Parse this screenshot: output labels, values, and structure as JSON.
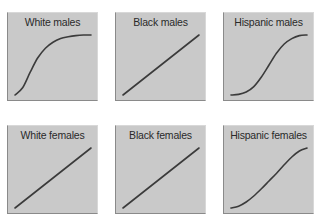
{
  "chart_data": [
    {
      "type": "line",
      "title": "White males",
      "shape": "concave-saturating (rapid rise then plateau)",
      "x": [
        0,
        0.1,
        0.2,
        0.3,
        0.4,
        0.5,
        0.6,
        0.7,
        0.8,
        0.9,
        1.0
      ],
      "y": [
        0.0,
        0.12,
        0.38,
        0.62,
        0.78,
        0.88,
        0.94,
        0.97,
        0.99,
        1.0,
        1.0
      ],
      "xlabel": "",
      "ylabel": "",
      "xlim": [
        0,
        1
      ],
      "ylim": [
        0,
        1
      ],
      "axes": "unlabeled",
      "grid": false
    },
    {
      "type": "line",
      "title": "Black males",
      "shape": "linear",
      "x": [
        0,
        1
      ],
      "y": [
        0,
        1
      ],
      "xlabel": "",
      "ylabel": "",
      "xlim": [
        0,
        1
      ],
      "ylim": [
        0,
        1
      ],
      "axes": "unlabeled",
      "grid": false
    },
    {
      "type": "line",
      "title": "Hispanic males",
      "shape": "sigmoid (slow start, steep middle, plateau)",
      "x": [
        0,
        0.1,
        0.2,
        0.3,
        0.4,
        0.5,
        0.6,
        0.7,
        0.8,
        0.9,
        1.0
      ],
      "y": [
        0.0,
        0.01,
        0.05,
        0.14,
        0.3,
        0.5,
        0.7,
        0.85,
        0.94,
        0.99,
        1.0
      ],
      "xlabel": "",
      "ylabel": "",
      "xlim": [
        0,
        1
      ],
      "ylim": [
        0,
        1
      ],
      "axes": "unlabeled",
      "grid": false
    },
    {
      "type": "line",
      "title": "White females",
      "shape": "linear",
      "x": [
        0,
        1
      ],
      "y": [
        0,
        1
      ],
      "xlabel": "",
      "ylabel": "",
      "xlim": [
        0,
        1
      ],
      "ylim": [
        0,
        1
      ],
      "axes": "unlabeled",
      "grid": false
    },
    {
      "type": "line",
      "title": "Black females",
      "shape": "linear",
      "x": [
        0,
        1
      ],
      "y": [
        0,
        1
      ],
      "xlabel": "",
      "ylabel": "",
      "xlim": [
        0,
        1
      ],
      "ylim": [
        0,
        1
      ],
      "axes": "unlabeled",
      "grid": false
    },
    {
      "type": "line",
      "title": "Hispanic females",
      "shape": "mild S-curve (slow start, near-linear middle, slight plateau)",
      "x": [
        0,
        0.1,
        0.2,
        0.3,
        0.4,
        0.5,
        0.6,
        0.7,
        0.8,
        0.9,
        1.0
      ],
      "y": [
        0.0,
        0.03,
        0.1,
        0.2,
        0.32,
        0.45,
        0.58,
        0.72,
        0.85,
        0.95,
        1.0
      ],
      "xlabel": "",
      "ylabel": "",
      "xlim": [
        0,
        1
      ],
      "ylim": [
        0,
        1
      ],
      "axes": "unlabeled",
      "grid": false
    }
  ],
  "colors": {
    "panel_bg": "#c9c9c9",
    "curve": "#3b3b3b",
    "title_text": "#2a2a2a"
  }
}
